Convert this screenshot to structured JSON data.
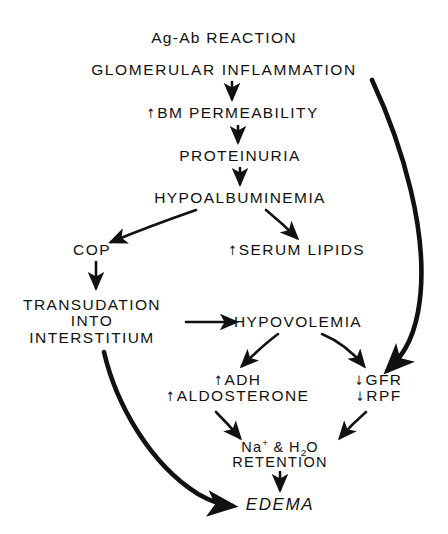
{
  "diagram": {
    "type": "flowchart",
    "background_color": "#ffffff",
    "stroke_color": "#111111",
    "nodes": [
      {
        "id": "ag_ab",
        "label": "Ag-Ab REACTION",
        "lines": [
          "Ag-Ab REACTION"
        ],
        "x": 224,
        "y": 38
      },
      {
        "id": "glomerular",
        "label": "GLOMERULAR INFLAMMATION",
        "lines": [
          "GLOMERULAR  INFLAMMATION"
        ],
        "x": 224,
        "y": 70
      },
      {
        "id": "bm_perm",
        "label": "↑BM PERMEABILITY",
        "arrow_prefix": "up",
        "lines": [
          "BM  PERMEABILITY"
        ],
        "x": 232,
        "y": 113
      },
      {
        "id": "proteinuria",
        "label": "PROTEINURIA",
        "lines": [
          "PROTEINURIA"
        ],
        "x": 240,
        "y": 156
      },
      {
        "id": "hypoalb",
        "label": "HYPOALBUMINEMIA",
        "lines": [
          "HYPOALBUMINEMIA"
        ],
        "x": 240,
        "y": 198
      },
      {
        "id": "cop",
        "label": "COP",
        "lines": [
          "COP"
        ],
        "x": 92,
        "y": 250
      },
      {
        "id": "serum_lipids",
        "label": "↑SERUM LIPIDS",
        "arrow_prefix": "up",
        "lines": [
          "SERUM  LIPIDS"
        ],
        "x": 296,
        "y": 250
      },
      {
        "id": "transudation",
        "label": "TRANSUDATION INTO INTERSTITIUM",
        "lines": [
          "TRANSUDATION",
          "INTO",
          "INTERSTITIUM"
        ],
        "x": 92,
        "y": 322
      },
      {
        "id": "hypovolemia",
        "label": "HYPOVOLEMIA",
        "lines": [
          "HYPOVOLEMIA"
        ],
        "x": 298,
        "y": 322
      },
      {
        "id": "adh_aldo",
        "label": "↑ADH ↑ALDOSTERONE",
        "lines": [
          "ADH",
          "ALDOSTERONE"
        ],
        "x": 237,
        "y": 388
      },
      {
        "id": "gfr_rpf",
        "label": "↓GFR ↓RPF",
        "lines": [
          "GFR",
          "RPF"
        ],
        "x": 378,
        "y": 388
      },
      {
        "id": "retention",
        "label": "Na+ & H2O RETENTION",
        "lines": [
          "Na+ & H2O",
          "RETENTION"
        ],
        "x": 280,
        "y": 455
      },
      {
        "id": "edema",
        "label": "EDEMA",
        "lines": [
          "EDEMA"
        ],
        "x": 280,
        "y": 505
      }
    ],
    "edges": [
      {
        "from": "glomerular",
        "to": "bm_perm",
        "style": "straight",
        "weight": "normal"
      },
      {
        "from": "bm_perm",
        "to": "proteinuria",
        "style": "straight",
        "weight": "normal"
      },
      {
        "from": "proteinuria",
        "to": "hypoalb",
        "style": "straight",
        "weight": "normal"
      },
      {
        "from": "hypoalb",
        "to": "cop",
        "style": "diagonal",
        "weight": "normal"
      },
      {
        "from": "hypoalb",
        "to": "serum_lipids",
        "style": "diagonal",
        "weight": "normal"
      },
      {
        "from": "cop",
        "to": "transudation",
        "style": "straight",
        "weight": "normal"
      },
      {
        "from": "transudation",
        "to": "hypovolemia",
        "style": "straight",
        "weight": "normal"
      },
      {
        "from": "hypovolemia",
        "to": "adh_aldo",
        "style": "curved",
        "weight": "normal"
      },
      {
        "from": "hypovolemia",
        "to": "gfr_rpf",
        "style": "curved",
        "weight": "normal"
      },
      {
        "from": "glomerular",
        "to": "gfr_rpf",
        "style": "long-curve-right",
        "weight": "bold"
      },
      {
        "from": "adh_aldo",
        "to": "retention",
        "style": "diagonal",
        "weight": "normal"
      },
      {
        "from": "gfr_rpf",
        "to": "retention",
        "style": "diagonal",
        "weight": "normal"
      },
      {
        "from": "retention",
        "to": "edema",
        "style": "straight",
        "weight": "normal"
      },
      {
        "from": "transudation",
        "to": "edema",
        "style": "long-curve-left",
        "weight": "bold"
      }
    ],
    "symbols": {
      "increase": "↑",
      "decrease": "↓"
    }
  }
}
